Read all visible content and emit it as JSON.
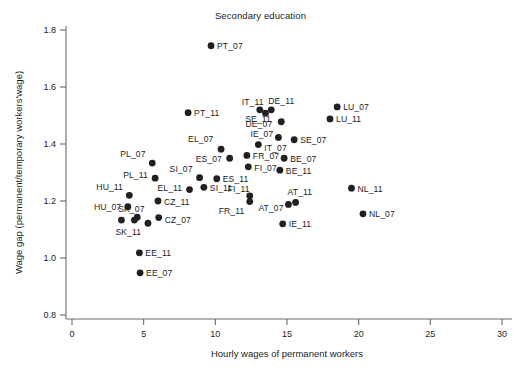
{
  "chart_data": {
    "type": "scatter",
    "title": "Secondary education",
    "xlabel": "Hourly wages of permanent workers",
    "ylabel": "Wage gap (permanent/temporary workers'wage)",
    "xlim": [
      0,
      30
    ],
    "ylim": [
      0.8,
      1.8
    ],
    "xticks": [
      0,
      5,
      10,
      15,
      20,
      25,
      30
    ],
    "xtick_labels": [
      "0",
      "5",
      "10",
      "15",
      "20",
      "25",
      "30"
    ],
    "yticks": [
      0.8,
      1.0,
      1.2,
      1.4,
      1.6,
      1.8
    ],
    "ytick_labels": [
      "0.8",
      "1.0",
      "1.2",
      "1.4",
      "1.6",
      "1.8"
    ],
    "grid": false,
    "legend": false,
    "marker": "filled-circle",
    "marker_color": "#231f20",
    "points": [
      {
        "label": "PT_07",
        "x": 9.7,
        "y": 1.745,
        "lx": 6,
        "ly": 3.5
      },
      {
        "label": "PT_11",
        "x": 8.1,
        "y": 1.51,
        "lx": 6,
        "ly": 3.5
      },
      {
        "label": "IT_11",
        "x": 13.1,
        "y": 1.52,
        "lx": -18,
        "ly": -5
      },
      {
        "label": "DE_11",
        "x": 13.9,
        "y": 1.52,
        "lx": -3,
        "ly": -6
      },
      {
        "label": "SE_11",
        "x": 14.6,
        "y": 1.478,
        "lx": -36,
        "ly": 0
      },
      {
        "label": "DE_07",
        "x": 13.5,
        "y": 1.508,
        "lx": -20,
        "ly": 14
      },
      {
        "label": "IE_07",
        "x": 14.4,
        "y": 1.423,
        "lx": -28,
        "ly": 0
      },
      {
        "label": "SE_07",
        "x": 15.5,
        "y": 1.415,
        "lx": 6,
        "ly": 3.5
      },
      {
        "label": "LU_07",
        "x": 18.5,
        "y": 1.53,
        "lx": 6,
        "ly": 3.5
      },
      {
        "label": "LU_11",
        "x": 18.0,
        "y": 1.488,
        "lx": 6,
        "ly": 3.5
      },
      {
        "label": "EL_07",
        "x": 10.4,
        "y": 1.382,
        "lx": -33,
        "ly": -7
      },
      {
        "label": "IT_07",
        "x": 13.0,
        "y": 1.398,
        "lx": 6,
        "ly": 6
      },
      {
        "label": "FR_07",
        "x": 12.2,
        "y": 1.36,
        "lx": 6,
        "ly": 3.5
      },
      {
        "label": "BE_07",
        "x": 14.8,
        "y": 1.35,
        "lx": 6,
        "ly": 3.5
      },
      {
        "label": "ES_07",
        "x": 11.0,
        "y": 1.35,
        "lx": -34,
        "ly": 3.5
      },
      {
        "label": "FI_07",
        "x": 12.3,
        "y": 1.32,
        "lx": 6,
        "ly": 4
      },
      {
        "label": "BE_11",
        "x": 14.5,
        "y": 1.308,
        "lx": 6,
        "ly": 4
      },
      {
        "label": "PL_07",
        "x": 5.6,
        "y": 1.333,
        "lx": -32,
        "ly": -6
      },
      {
        "label": "SI_07",
        "x": 8.9,
        "y": 1.282,
        "lx": -30,
        "ly": -6
      },
      {
        "label": "ES_11",
        "x": 10.1,
        "y": 1.278,
        "lx": 6,
        "ly": 3.5
      },
      {
        "label": "PL_11",
        "x": 5.8,
        "y": 1.28,
        "lx": -32,
        "ly": 0
      },
      {
        "label": "SI_11",
        "x": 9.2,
        "y": 1.248,
        "lx": 6,
        "ly": 3.5
      },
      {
        "label": "NL_11",
        "x": 19.5,
        "y": 1.245,
        "lx": 6,
        "ly": 3.5
      },
      {
        "label": "HU_11",
        "x": 4.0,
        "y": 1.22,
        "lx": -33,
        "ly": -5
      },
      {
        "label": "EL_11",
        "x": 8.2,
        "y": 1.24,
        "lx": -32,
        "ly": 1
      },
      {
        "label": "FI_11",
        "x": 12.4,
        "y": 1.218,
        "lx": -22,
        "ly": -4
      },
      {
        "label": "FR_11",
        "x": 12.4,
        "y": 1.198,
        "lx": -31,
        "ly": 12
      },
      {
        "label": "AT_11",
        "x": 15.6,
        "y": 1.195,
        "lx": -8,
        "ly": -7
      },
      {
        "label": "AT_07",
        "x": 15.1,
        "y": 1.188,
        "lx": -30,
        "ly": 7
      },
      {
        "label": "CZ_11",
        "x": 6.0,
        "y": 1.2,
        "lx": 6,
        "ly": 4
      },
      {
        "label": "HU_07",
        "x": 3.9,
        "y": 1.18,
        "lx": -34,
        "ly": 3.5
      },
      {
        "label": "SK_07",
        "x": 4.55,
        "y": 1.143,
        "lx": -19,
        "ly": -5
      },
      {
        "label": "CZ_07",
        "x": 6.05,
        "y": 1.142,
        "lx": 6,
        "ly": 5
      },
      {
        "label": "NL_07",
        "x": 20.3,
        "y": 1.155,
        "lx": 6,
        "ly": 3.5
      },
      {
        "label": "SK_11",
        "x": 3.45,
        "y": 1.133,
        "lx": -6,
        "ly": 15
      },
      {
        "label": "IE_11",
        "x": 14.7,
        "y": 1.12,
        "lx": 6,
        "ly": 3.5
      },
      {
        "label": "EE_11",
        "x": 4.7,
        "y": 1.018,
        "lx": 6,
        "ly": 3.5
      },
      {
        "label": "EE_07",
        "x": 4.75,
        "y": 0.948,
        "lx": 6,
        "ly": 3.5
      },
      {
        "label": "",
        "x": 4.35,
        "y": 1.133,
        "lx": 0,
        "ly": 0
      },
      {
        "label": "",
        "x": 5.3,
        "y": 1.122,
        "lx": 0,
        "ly": 0
      }
    ]
  },
  "axes": {
    "title": "Secondary education",
    "x_axis_label": "Hourly wages of permanent workers",
    "y_axis_label": "Wage gap (permanent/temporary workers'wage)"
  },
  "style": {
    "axis_color": "#6b6b6b",
    "marker_color": "#231f20",
    "text_color": "#1c1c1c",
    "background": "#ffffff"
  }
}
